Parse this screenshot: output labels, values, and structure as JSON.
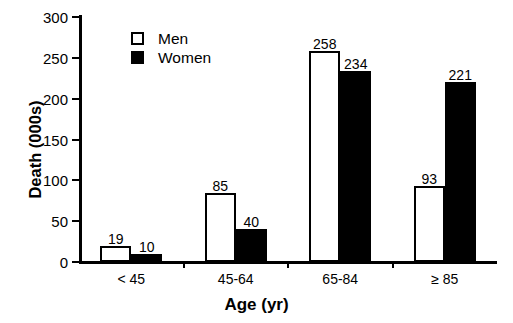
{
  "chart_data": {
    "type": "bar",
    "title": "",
    "subtitle": "",
    "xlabel": "Age (yr)",
    "ylabel": "Death (000s)",
    "categories": [
      "< 45",
      "45-64",
      "65-84",
      "≥ 85"
    ],
    "series": [
      {
        "name": "Men",
        "color": "#ffffff",
        "edge": "#000000",
        "values": [
          19,
          85,
          258,
          93
        ]
      },
      {
        "name": "Women",
        "color": "#000000",
        "edge": "#000000",
        "values": [
          10,
          40,
          234,
          221
        ]
      }
    ],
    "value_labels": [
      [
        "19",
        "85",
        "258",
        "93"
      ],
      [
        "10",
        "40",
        "234",
        "221"
      ]
    ],
    "ylim": [
      0,
      300
    ],
    "yticks": [
      0,
      50,
      100,
      150,
      200,
      250,
      300
    ],
    "ytick_labels": [
      "0",
      "50",
      "100",
      "150",
      "200",
      "250",
      "300"
    ],
    "grid": false,
    "legend": {
      "position": "top-left",
      "entries": [
        "Men",
        "Women"
      ]
    },
    "bar_value_labels_shown": true,
    "spines": {
      "left": true,
      "bottom": true,
      "top": false,
      "right": false
    }
  },
  "legend": {
    "men": "Men",
    "women": "Women"
  },
  "axes": {
    "y_title": "Death (000s)",
    "x_title": "Age (yr)"
  }
}
